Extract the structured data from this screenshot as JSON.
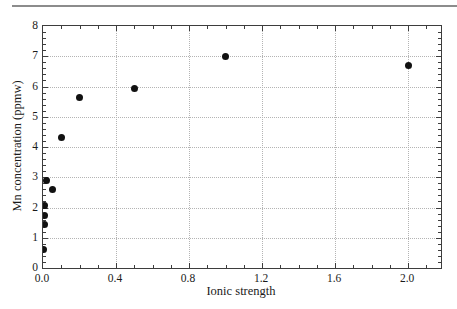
{
  "figure": {
    "top_rule_color": "#8c8c8c",
    "background_color": "#ffffff"
  },
  "chart_data": {
    "type": "scatter",
    "title": "",
    "xlabel": "Ionic strength",
    "ylabel": "Mn concentration (ppmw)",
    "xlim": [
      0,
      2.18
    ],
    "ylim": [
      0,
      8
    ],
    "x_major_ticks": [
      0.0,
      0.4,
      0.8,
      1.2,
      1.6,
      2.0
    ],
    "x_tick_labels": [
      "0.0",
      "0.4",
      "0.8",
      "1.2",
      "1.6",
      "2.0"
    ],
    "x_minor_step": 0.1,
    "y_major_ticks": [
      0,
      1,
      2,
      3,
      4,
      5,
      6,
      7,
      8
    ],
    "y_tick_labels": [
      "0",
      "1",
      "2",
      "3",
      "4",
      "5",
      "6",
      "7",
      "8"
    ],
    "y_minor_step": 0.2,
    "grid": {
      "style": "dotted",
      "on_major_ticks": true,
      "horizontal": true,
      "vertical": true
    },
    "legend": "none",
    "marker": {
      "shape": "filled-circle",
      "diameter_px": 7
    },
    "points": [
      {
        "x": 0.005,
        "y": 0.6
      },
      {
        "x": 0.01,
        "y": 1.45
      },
      {
        "x": 0.01,
        "y": 1.75
      },
      {
        "x": 0.01,
        "y": 2.05
      },
      {
        "x": 0.02,
        "y": 2.9
      },
      {
        "x": 0.05,
        "y": 2.6
      },
      {
        "x": 0.1,
        "y": 4.3
      },
      {
        "x": 0.2,
        "y": 5.65
      },
      {
        "x": 0.5,
        "y": 5.95
      },
      {
        "x": 1.0,
        "y": 7.0
      },
      {
        "x": 2.0,
        "y": 6.7
      }
    ],
    "colors": {
      "axis_frame": "#3d3d3d",
      "tick": "#3d3d3d",
      "grid": "#b4b4b4",
      "marker": "#111111",
      "text": "#1a1a1a"
    }
  }
}
